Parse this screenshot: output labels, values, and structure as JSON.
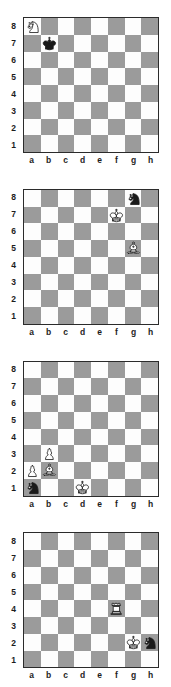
{
  "page": {
    "board_count": 4,
    "colors": {
      "light_square": "#fdfdfd",
      "dark_square": "#9b9b9b",
      "border": "#2b2b2b",
      "label": "#1d1d1d",
      "page_background": "#ffffff",
      "white_piece_fill": "#ffffff",
      "black_piece_fill": "#1a1a1a",
      "piece_outline": "#1a1a1a"
    }
  },
  "coordinates": {
    "files": [
      "a",
      "b",
      "c",
      "d",
      "e",
      "f",
      "g",
      "h"
    ],
    "ranks": [
      "8",
      "7",
      "6",
      "5",
      "4",
      "3",
      "2",
      "1"
    ]
  },
  "boards": [
    {
      "index": 1,
      "name": "diagram-1",
      "pieces": [
        {
          "square": "a8",
          "color": "white",
          "type": "knight",
          "glyph": "white-knight-icon"
        },
        {
          "square": "b7",
          "color": "black",
          "type": "king",
          "glyph": "black-king-icon"
        }
      ]
    },
    {
      "index": 2,
      "name": "diagram-2",
      "pieces": [
        {
          "square": "g8",
          "color": "black",
          "type": "knight",
          "glyph": "black-knight-icon"
        },
        {
          "square": "f7",
          "color": "white",
          "type": "king",
          "glyph": "white-king-icon"
        },
        {
          "square": "g5",
          "color": "white",
          "type": "bishop",
          "glyph": "white-bishop-icon"
        }
      ]
    },
    {
      "index": 3,
      "name": "diagram-3",
      "pieces": [
        {
          "square": "b3",
          "color": "white",
          "type": "pawn",
          "glyph": "white-pawn-icon"
        },
        {
          "square": "a2",
          "color": "white",
          "type": "pawn",
          "glyph": "white-pawn-icon"
        },
        {
          "square": "b2",
          "color": "white",
          "type": "bishop",
          "glyph": "white-bishop-icon"
        },
        {
          "square": "a1",
          "color": "black",
          "type": "knight",
          "glyph": "black-knight-icon"
        },
        {
          "square": "d1",
          "color": "white",
          "type": "king",
          "glyph": "white-king-icon"
        }
      ]
    },
    {
      "index": 4,
      "name": "diagram-4",
      "pieces": [
        {
          "square": "f4",
          "color": "white",
          "type": "rook",
          "glyph": "white-rook-icon"
        },
        {
          "square": "g2",
          "color": "white",
          "type": "king",
          "glyph": "white-king-icon"
        },
        {
          "square": "h2",
          "color": "black",
          "type": "knight",
          "glyph": "black-knight-icon"
        }
      ]
    }
  ]
}
